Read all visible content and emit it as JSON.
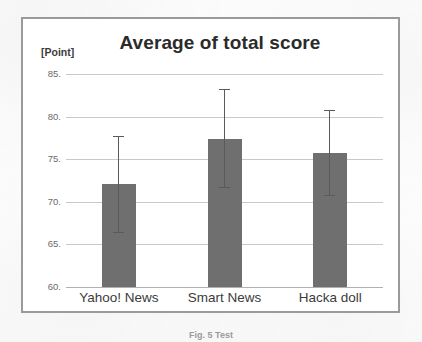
{
  "figure": {
    "caption": "Fig. 5   Test"
  },
  "chart_data": {
    "type": "bar",
    "title": "Average of total score",
    "unit_label": "[Point]",
    "xlabel": "",
    "ylabel": "[Point]",
    "categories": [
      "Yahoo! News",
      "Smart News",
      "Hacka doll"
    ],
    "values": [
      72.1,
      77.4,
      75.7
    ],
    "errors_upper": [
      77.7,
      83.2,
      80.8
    ],
    "errors_lower": [
      66.5,
      71.7,
      70.8
    ],
    "error_margins": [
      5.6,
      5.8,
      5.1
    ],
    "ylim": [
      60,
      85
    ],
    "yticks": [
      85,
      80,
      75,
      70,
      65,
      60
    ],
    "ytick_labels": [
      "85.",
      "80.",
      "75.",
      "70.",
      "65.",
      "60."
    ],
    "grid": true,
    "legend": "none",
    "bar_color": "#6f6f6f",
    "gridline_color": "#c9c9c9",
    "error_bar_color": "#5a5a5a",
    "title_color": "#2b2b2b",
    "frame_color": "#9a9a9a"
  }
}
